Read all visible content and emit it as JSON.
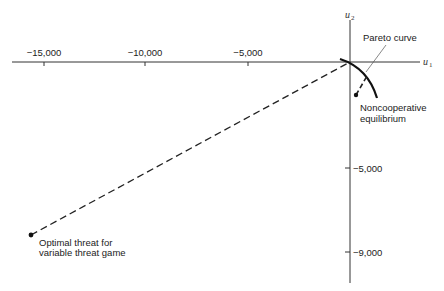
{
  "diagram": {
    "type": "game-theory-utility-space",
    "axes": {
      "x": {
        "name": "u",
        "subscript": "1",
        "ticks": [
          {
            "label": "−15,000",
            "value": -15000
          },
          {
            "label": "−10,000",
            "value": -10000
          },
          {
            "label": "−5,000",
            "value": -5000
          }
        ]
      },
      "y": {
        "name": "u",
        "subscript": "2",
        "ticks": [
          {
            "label": "−5,000",
            "value": -5000
          },
          {
            "label": "−9,000",
            "value": -9000
          }
        ]
      }
    },
    "annotations": {
      "pareto": "Pareto curve",
      "noncoop_line1": "Noncooperative",
      "noncoop_line2": "equilibrium",
      "threat_line1": "Optimal threat for",
      "threat_line2": "variable threat game"
    },
    "points": [
      {
        "name": "Noncooperative equilibrium"
      },
      {
        "name": "Optimal threat for variable threat game"
      }
    ],
    "colors": {
      "ink": "#222222",
      "background": "#ffffff"
    }
  }
}
